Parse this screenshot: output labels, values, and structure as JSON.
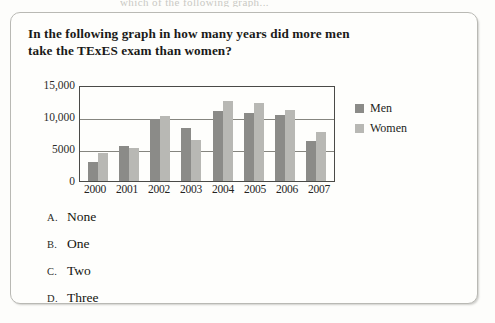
{
  "page": {
    "cropped_top_line": "which of the following graph..."
  },
  "question": {
    "text": "In the following graph in how many years did more men take the TExES exam than women?"
  },
  "chart_data": {
    "type": "bar",
    "title": "",
    "xlabel": "",
    "ylabel": "",
    "categories": [
      "2000",
      "2001",
      "2002",
      "2003",
      "2004",
      "2005",
      "2006",
      "2007"
    ],
    "series": [
      {
        "name": "Men",
        "color": "#8b8b88",
        "values": [
          3000,
          5400,
          9700,
          8300,
          11000,
          10600,
          10300,
          6300
        ]
      },
      {
        "name": "Women",
        "color": "#b8b8b4",
        "values": [
          4300,
          5100,
          10200,
          6400,
          12500,
          12200,
          11100,
          7700
        ]
      }
    ],
    "ylim": [
      0,
      15000
    ],
    "y_ticks": [
      0,
      5000,
      10000,
      15000
    ],
    "y_tick_labels": [
      "0",
      "5000",
      "10,000",
      "15,000"
    ],
    "grid": true,
    "legend_position": "right",
    "legend": [
      "Men",
      "Women"
    ]
  },
  "answers": [
    {
      "letter": "A.",
      "label": "None"
    },
    {
      "letter": "B.",
      "label": "One"
    },
    {
      "letter": "C.",
      "label": "Two"
    },
    {
      "letter": "D.",
      "label": "Three"
    }
  ]
}
